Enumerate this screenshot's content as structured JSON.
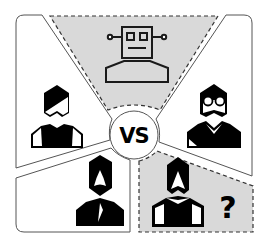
{
  "diagram": {
    "center": {
      "label": "VS"
    },
    "panels": [
      {
        "id": "top",
        "subject": "robot",
        "icon": "robot-icon",
        "highlighted": true
      },
      {
        "id": "left",
        "subject": "person",
        "icon": "person-icon"
      },
      {
        "id": "right",
        "subject": "person-with-glasses",
        "icon": "person-glasses-icon"
      },
      {
        "id": "bottom-left",
        "subject": "bearded-person",
        "icon": "person-beard-icon"
      },
      {
        "id": "bottom-right",
        "subject": "unknown-person",
        "icon": "person-long-hair-icon",
        "highlighted": true,
        "badge": "?"
      }
    ],
    "colors": {
      "highlight_fill": "#d9d9d9",
      "stroke": "#333333",
      "icon": "#000000",
      "background": "#ffffff"
    }
  }
}
